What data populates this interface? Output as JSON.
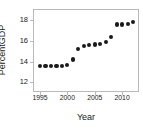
{
  "chart_data": {
    "type": "scatter",
    "title": "",
    "xlabel": "Year",
    "ylabel": "PercentGDP",
    "xlim": [
      1993.9,
      2012.9
    ],
    "ylim": [
      11.15,
      19.0
    ],
    "xticks": [
      1995,
      2000,
      2005,
      2010
    ],
    "xtick_labels": [
      "1995",
      "2000",
      "2005",
      "2010"
    ],
    "yticks": [
      12,
      14,
      16,
      18
    ],
    "ytick_labels": [
      "12",
      "14",
      "16",
      "18"
    ],
    "grid": false,
    "legend": null,
    "marker": "filled-circle",
    "marker_color": "#1a1a1a",
    "frame_color": "#b9b9b9",
    "x": [
      1995,
      1996,
      1997,
      1998,
      1999,
      2000,
      2001,
      2002,
      2003,
      2004,
      2005,
      2006,
      2007,
      2008,
      2009,
      2010,
      2011,
      2012
    ],
    "values": [
      13.6,
      13.6,
      13.6,
      13.6,
      13.6,
      13.65,
      14.2,
      15.2,
      15.55,
      15.6,
      15.65,
      15.7,
      15.9,
      16.4,
      17.6,
      17.6,
      17.65,
      17.8
    ],
    "series": [
      {
        "name": "PercentGDP",
        "points": [
          {
            "x": 1995,
            "y": 13.6
          },
          {
            "x": 1996,
            "y": 13.6
          },
          {
            "x": 1997,
            "y": 13.6
          },
          {
            "x": 1998,
            "y": 13.6
          },
          {
            "x": 1999,
            "y": 13.6
          },
          {
            "x": 2000,
            "y": 13.65
          },
          {
            "x": 2001,
            "y": 14.2
          },
          {
            "x": 2002,
            "y": 15.2
          },
          {
            "x": 2003,
            "y": 15.55
          },
          {
            "x": 2004,
            "y": 15.6
          },
          {
            "x": 2005,
            "y": 15.65
          },
          {
            "x": 2006,
            "y": 15.7
          },
          {
            "x": 2007,
            "y": 15.9
          },
          {
            "x": 2008,
            "y": 16.4
          },
          {
            "x": 2009,
            "y": 17.6
          },
          {
            "x": 2010,
            "y": 17.6
          },
          {
            "x": 2011,
            "y": 17.65
          },
          {
            "x": 2012,
            "y": 17.8
          }
        ]
      }
    ]
  }
}
